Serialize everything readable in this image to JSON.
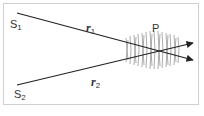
{
  "diagram": {
    "sources": [
      {
        "label": "S",
        "subscript": "1"
      },
      {
        "label": "S",
        "subscript": "2"
      }
    ],
    "paths": [
      {
        "label": "r",
        "subscript": "1"
      },
      {
        "label": "r",
        "subscript": "2"
      }
    ],
    "point": {
      "label": "P"
    },
    "colors": {
      "line": "#222222",
      "wave": "#888888",
      "border": "#cfcfcf"
    }
  }
}
